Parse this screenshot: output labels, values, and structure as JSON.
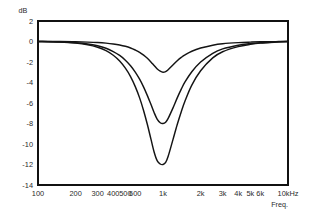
{
  "chart_data": {
    "type": "line",
    "title": "",
    "subtitle": "",
    "xlabel": "Freq.",
    "ylabel": "dB",
    "xscale": "log",
    "xlim": [
      100,
      10000
    ],
    "ylim": [
      -14,
      2
    ],
    "grid": true,
    "legend": "none",
    "x_tick_labels": [
      "100",
      "200",
      "300",
      "400",
      "500",
      "600",
      "1k",
      "2k",
      "3k",
      "4k",
      "5k",
      "6k",
      "10kHz"
    ],
    "x_tick_values": [
      100,
      200,
      300,
      400,
      500,
      600,
      1000,
      2000,
      3000,
      4000,
      5000,
      6000,
      10000
    ],
    "y_tick_labels": [
      "2",
      "0",
      "-2",
      "-4",
      "-6",
      "-8",
      "-10",
      "-12",
      "-14"
    ],
    "y_tick_values": [
      2,
      0,
      -2,
      -4,
      -6,
      -8,
      -10,
      -12,
      -14
    ],
    "center_frequency": 1000,
    "annotations": [],
    "series": [
      {
        "name": "Cut -3 dB",
        "peak_gain_db": -3,
        "x": [
          100,
          150,
          200,
          250,
          300,
          350,
          400,
          450,
          500,
          550,
          600,
          650,
          700,
          750,
          800,
          850,
          900,
          950,
          1000,
          1050,
          1100,
          1200,
          1300,
          1400,
          1500,
          1700,
          2000,
          2500,
          3000,
          4000,
          5000,
          6000,
          8000,
          10000
        ],
        "y": [
          0,
          0,
          -0.03,
          -0.06,
          -0.1,
          -0.16,
          -0.24,
          -0.34,
          -0.47,
          -0.63,
          -0.83,
          -1.05,
          -1.33,
          -1.64,
          -1.99,
          -2.35,
          -2.68,
          -2.9,
          -3,
          -2.93,
          -2.75,
          -2.3,
          -1.88,
          -1.55,
          -1.3,
          -0.95,
          -0.64,
          -0.36,
          -0.22,
          -0.11,
          -0.06,
          -0.03,
          -0.01,
          0
        ]
      },
      {
        "name": "Cut -8 dB",
        "peak_gain_db": -8,
        "x": [
          100,
          150,
          200,
          250,
          300,
          350,
          400,
          450,
          500,
          550,
          600,
          650,
          700,
          750,
          800,
          850,
          900,
          950,
          1000,
          1050,
          1100,
          1200,
          1300,
          1400,
          1500,
          1700,
          2000,
          2500,
          3000,
          4000,
          5000,
          6000,
          8000,
          10000
        ],
        "y": [
          0,
          -0.04,
          -0.12,
          -0.24,
          -0.42,
          -0.66,
          -0.98,
          -1.36,
          -1.82,
          -2.36,
          -2.98,
          -3.68,
          -4.45,
          -5.28,
          -6.13,
          -6.95,
          -7.6,
          -7.93,
          -8,
          -7.87,
          -7.5,
          -6.5,
          -5.5,
          -4.65,
          -3.95,
          -2.95,
          -2.0,
          -1.15,
          -0.72,
          -0.36,
          -0.2,
          -0.12,
          -0.05,
          0
        ]
      },
      {
        "name": "Cut -12 dB",
        "peak_gain_db": -12,
        "x": [
          100,
          150,
          200,
          250,
          300,
          350,
          400,
          450,
          500,
          550,
          600,
          650,
          700,
          750,
          800,
          850,
          900,
          950,
          1000,
          1050,
          1100,
          1200,
          1300,
          1400,
          1500,
          1700,
          2000,
          2500,
          3000,
          4000,
          5000,
          6000,
          8000,
          10000
        ],
        "y": [
          0,
          -0.06,
          -0.16,
          -0.32,
          -0.56,
          -0.9,
          -1.34,
          -1.9,
          -2.6,
          -3.42,
          -4.4,
          -5.5,
          -6.75,
          -8.1,
          -9.5,
          -10.8,
          -11.65,
          -11.95,
          -12,
          -11.8,
          -11.2,
          -9.6,
          -8.1,
          -6.85,
          -5.8,
          -4.25,
          -2.85,
          -1.6,
          -1.0,
          -0.5,
          -0.28,
          -0.16,
          -0.06,
          0
        ]
      }
    ]
  },
  "axes": {
    "y_unit": "dB",
    "x_name": "Freq."
  },
  "colors": {
    "frame": "#111111",
    "grid": "#6f6f6f",
    "curve": "#141414",
    "background": "#ffffff",
    "text": "#2b2b2b"
  }
}
